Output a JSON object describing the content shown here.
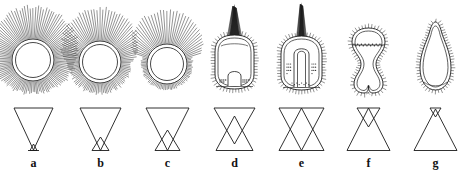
{
  "figure": {
    "kind": "scientific-line-drawing-plate",
    "columns": 7,
    "rows": 2,
    "background_color": "#ffffff",
    "line_color": "#1a1a1a",
    "fill_color": "#3a3a3a"
  },
  "panels": [
    {
      "label": "a",
      "specimen": {
        "shape": "circle",
        "wall": "double",
        "spines": "long-radiating-all-around",
        "spine_length": "long",
        "apical_tuft": "none",
        "interior": "empty"
      },
      "schema": {
        "down_triangle": "large",
        "up_triangle": "tiny",
        "overlap": "apex-only"
      }
    },
    {
      "label": "b",
      "specimen": {
        "shape": "circle",
        "wall": "double",
        "spines": "long-above-short-below",
        "spine_length": "long",
        "apical_tuft": "none",
        "interior": "empty"
      },
      "schema": {
        "down_triangle": "large",
        "up_triangle": "small",
        "overlap": "low"
      }
    },
    {
      "label": "c",
      "specimen": {
        "shape": "circle",
        "wall": "double",
        "spines": "long-crest-above-short-margin",
        "spine_length": "medium",
        "apical_tuft": "none",
        "interior": "empty"
      },
      "schema": {
        "down_triangle": "large",
        "up_triangle": "medium-small",
        "overlap": "low-medium"
      }
    },
    {
      "label": "d",
      "specimen": {
        "shape": "rounded-square",
        "wall": "double",
        "spines": "short-marginal",
        "spine_length": "short",
        "apical_tuft": "dark-fan",
        "interior": "low-arch-with-basal-granules"
      },
      "schema": {
        "down_triangle": "medium",
        "up_triangle": "medium",
        "overlap": "mid"
      }
    },
    {
      "label": "e",
      "specimen": {
        "shape": "rounded-square",
        "wall": "double",
        "spines": "short-marginal",
        "spine_length": "short",
        "apical_tuft": "dark-spike",
        "interior": "tall-u-loop-with-lateral-granules"
      },
      "schema": {
        "down_triangle": "large",
        "up_triangle": "large",
        "overlap": "full-x"
      }
    },
    {
      "label": "f",
      "specimen": {
        "shape": "hourglass-bilobed",
        "wall": "double",
        "spines": "short-marginal",
        "spine_length": "short",
        "apical_tuft": "none",
        "interior": "transverse-granule-band"
      },
      "schema": {
        "down_triangle": "small",
        "up_triangle": "large",
        "overlap": "high"
      }
    },
    {
      "label": "g",
      "specimen": {
        "shape": "pear-pyriform",
        "wall": "double",
        "spines": "short-marginal",
        "spine_length": "short",
        "apical_tuft": "small-apical-point",
        "interior": "empty"
      },
      "schema": {
        "down_triangle": "tiny",
        "up_triangle": "large",
        "overlap": "apex-only"
      }
    }
  ]
}
